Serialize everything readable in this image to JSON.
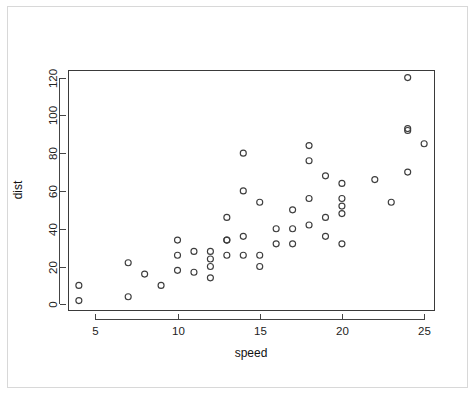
{
  "figure": {
    "background_color": "#ffffff",
    "frame_color": "#d8d8d8",
    "axis_color": "#444444",
    "point_color": "#3d3d3d"
  },
  "chart_data": {
    "type": "scatter",
    "title": "",
    "subtitle": "",
    "xlabel": "speed",
    "ylabel": "dist",
    "xlim": [
      3.4,
      25.6
    ],
    "ylim": [
      -3,
      124
    ],
    "xticks": [
      5,
      10,
      15,
      20,
      25
    ],
    "xtick_labels": [
      "5",
      "10",
      "15",
      "20",
      "25"
    ],
    "yticks": [
      0,
      20,
      40,
      60,
      80,
      100,
      120
    ],
    "ytick_labels": [
      "0",
      "20",
      "40",
      "60",
      "80",
      "100",
      "120"
    ],
    "grid": false,
    "legend": null,
    "legend_position": "none",
    "marker": "open-circle",
    "series": [
      {
        "name": "cars",
        "x": [
          4,
          4,
          7,
          7,
          8,
          9,
          10,
          10,
          10,
          11,
          11,
          12,
          12,
          12,
          12,
          13,
          13,
          13,
          13,
          14,
          14,
          14,
          14,
          15,
          15,
          15,
          16,
          16,
          17,
          17,
          17,
          18,
          18,
          18,
          18,
          19,
          19,
          19,
          20,
          20,
          20,
          20,
          20,
          22,
          23,
          24,
          24,
          24,
          24,
          25
        ],
        "y": [
          2,
          10,
          4,
          22,
          16,
          10,
          18,
          26,
          34,
          17,
          28,
          14,
          20,
          24,
          28,
          26,
          34,
          34,
          46,
          26,
          36,
          60,
          80,
          20,
          26,
          54,
          32,
          40,
          32,
          40,
          50,
          42,
          56,
          76,
          84,
          36,
          46,
          68,
          32,
          48,
          52,
          56,
          64,
          66,
          54,
          70,
          92,
          93,
          120,
          85
        ]
      }
    ],
    "n_points": 50
  }
}
